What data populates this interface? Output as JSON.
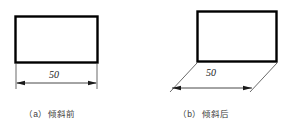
{
  "figure": {
    "type": "technical-drawing",
    "background_color": "#ffffff",
    "line_color": "#000000",
    "panels": [
      {
        "id": "a",
        "caption": "（a）倾斜前",
        "shape": "rectangle",
        "dimension_label": "50",
        "dimension_style": "horizontal-extension-lines",
        "rect": {
          "x": 15,
          "y": 16,
          "width": 83,
          "height": 47
        },
        "dimension_line_y": 83,
        "extension_line_angle_deg": 90
      },
      {
        "id": "b",
        "caption": "（b）倾斜后",
        "shape": "rectangle",
        "dimension_label": "50",
        "dimension_style": "oblique-extension-lines",
        "rect": {
          "x": 197,
          "y": 11,
          "width": 80,
          "height": 51
        },
        "dimension_line_y": 88,
        "extension_line_angle_deg": 45
      }
    ]
  },
  "labels": {
    "caption_a": "（a）倾斜前",
    "caption_b": "（b）倾斜后",
    "dimension_a": "50",
    "dimension_b": "50"
  },
  "colors": {
    "stroke": "#000000",
    "thin_stroke": "#1a1a1a",
    "caption_text": "#3b3b3b",
    "background": "#ffffff"
  }
}
